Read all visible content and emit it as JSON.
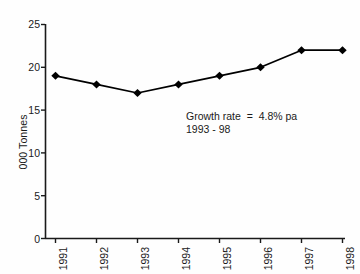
{
  "chart_data": {
    "type": "line",
    "title": "",
    "subtitle": "",
    "xlabel": "",
    "ylabel": "000 Tonnes",
    "categories": [
      "1991",
      "1992",
      "1993",
      "1994",
      "1995",
      "1996",
      "1997",
      "1998"
    ],
    "values": [
      19,
      18,
      17,
      18,
      19,
      20,
      22,
      22
    ],
    "series": [
      {
        "name": "",
        "values": [
          19,
          18,
          17,
          18,
          19,
          20,
          22,
          22
        ]
      }
    ],
    "ylim": [
      0,
      25
    ],
    "yticks": [
      0,
      5,
      10,
      15,
      20,
      25
    ],
    "ytick_labels": [
      "0",
      "5",
      "10",
      "15",
      "20",
      "25"
    ],
    "xtick_labels": [
      "1991",
      "1992",
      "1993",
      "1994",
      "1995",
      "1996",
      "1997",
      "1998"
    ],
    "xtick_rotation": -90,
    "grid": false,
    "legend": false,
    "legend_position": "none",
    "marker": "diamond",
    "line_color": "#000000",
    "marker_color": "#000000",
    "axis_color": "#1a1a1a",
    "background_color": "#fefefe",
    "annotations": [
      {
        "line1": "Growth rate  =  4.8% pa",
        "line2": "1993 - 98",
        "growth_rate": "4.8% pa",
        "period": "1993 - 98"
      }
    ]
  }
}
